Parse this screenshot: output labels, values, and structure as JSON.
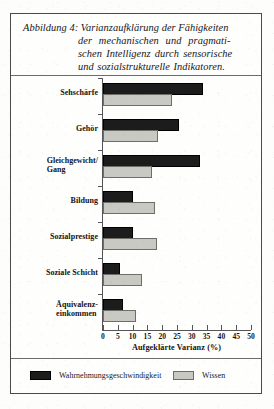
{
  "figure": {
    "caption_label": "Abbildung 4:",
    "caption_lines": [
      "Abbildung 4: Varianzaufklärung der Fähigkeiten",
      "der mechanischen und pragmati-",
      "schen Intelligenz durch sensorische",
      "und sozialstrukturelle Indikatoren."
    ]
  },
  "chart_data": {
    "type": "bar",
    "orientation": "horizontal",
    "xlabel": "Aufgeklärte Varianz (%)",
    "ylabel": "",
    "xlim": [
      0,
      50
    ],
    "xticks": [
      0,
      5,
      10,
      15,
      20,
      25,
      30,
      35,
      40,
      45,
      50
    ],
    "xtick_labels": [
      "0",
      "5",
      "10",
      "15",
      "20",
      "25",
      "30",
      "35",
      "40",
      "45",
      "50"
    ],
    "grid": false,
    "legend_position": "bottom",
    "categories": [
      "Sehschärfe",
      "Gehör",
      "Gleichgewicht/\nGang",
      "Bildung",
      "Sozialprestige",
      "Soziale Schicht",
      "Äquivalenz-\neinkommen"
    ],
    "series": [
      {
        "name": "Wahrnehmungsgeschwindigkeit",
        "color": "#1c1c1c",
        "values": [
          33,
          25,
          32,
          9.5,
          9.5,
          5,
          6
        ]
      },
      {
        "name": "Wissen",
        "color": "#c9c9c4",
        "values": [
          22.5,
          18,
          16,
          17,
          17.5,
          12.5,
          10.5
        ]
      }
    ]
  },
  "legend": {
    "items": [
      {
        "label": "Wahrnehmungsgeschwindigkeit",
        "swatch": "dark"
      },
      {
        "label": "Wissen",
        "swatch": "light"
      }
    ]
  }
}
